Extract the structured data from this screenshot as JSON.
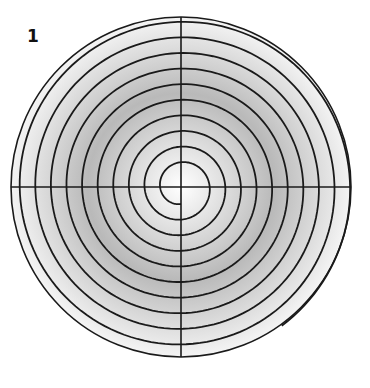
{
  "figure": {
    "label": "1",
    "center": [
      181,
      187
    ],
    "outer_radius": 170,
    "spiral": {
      "direction": "clockwise",
      "start_radius": 17,
      "spacing_per_turn": 15.6,
      "start_angle_deg": 90,
      "end_angle_deg": 57,
      "turns": 9.9
    },
    "colors": {
      "line": "#1a1a1a",
      "shade_center": "#ffffff",
      "shade_mid": "#b9b9b9",
      "shade_edge": "#f4f4f4"
    }
  }
}
